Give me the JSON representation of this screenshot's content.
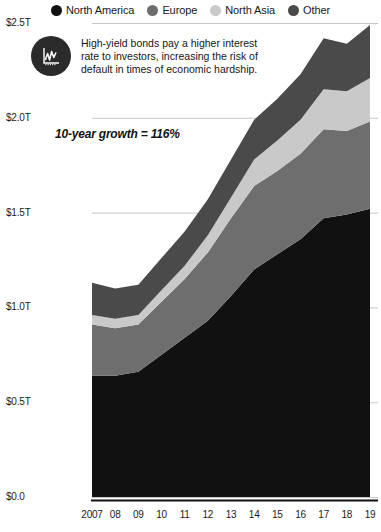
{
  "legend": {
    "position": "top-center",
    "items": [
      {
        "label": "North America",
        "color": "#111111",
        "icon": "legend-dot-icon"
      },
      {
        "label": "Europe",
        "color": "#6e6e6e",
        "icon": "legend-dot-icon"
      },
      {
        "label": "North Asia",
        "color": "#c9c9c9",
        "icon": "legend-dot-icon"
      },
      {
        "label": "Other",
        "color": "#4a4a4a",
        "icon": "legend-dot-icon"
      }
    ]
  },
  "callout": {
    "icon": "line-chart-badge-icon",
    "text": "High-yield bonds pay a higher interest rate to investors, increasing the risk of default in times of economic hardship."
  },
  "growth_note": "10-year growth = 116%",
  "axes": {
    "y_ticks": [
      "$0.0",
      "$0.5T",
      "$1.0T",
      "$1.5T",
      "$2.0T",
      "$2.5T"
    ],
    "x_ticks": [
      "2007",
      "08",
      "09",
      "10",
      "11",
      "12",
      "13",
      "14",
      "15",
      "16",
      "17",
      "18",
      "19"
    ]
  },
  "chart_data": {
    "type": "area",
    "title": "",
    "subtitle": "",
    "xlabel": "",
    "ylabel": "",
    "stacked": true,
    "grid": true,
    "legend_position": "top",
    "ylim": [
      0,
      2.5
    ],
    "ytick_values": [
      0,
      0.5,
      1.0,
      1.5,
      2.0,
      2.5
    ],
    "ytick_labels": [
      "$0.0",
      "$0.5T",
      "$1.0T",
      "$1.5T",
      "$2.0T",
      "$2.5T"
    ],
    "units": "USD trillions",
    "categories": [
      "2007",
      "08",
      "09",
      "10",
      "11",
      "12",
      "13",
      "14",
      "15",
      "16",
      "17",
      "18",
      "19"
    ],
    "x": [
      2007,
      2008,
      2009,
      2010,
      2011,
      2012,
      2013,
      2014,
      2015,
      2016,
      2017,
      2018,
      2019
    ],
    "series": [
      {
        "name": "North America",
        "color": "#111111",
        "values": [
          0.64,
          0.64,
          0.66,
          0.75,
          0.84,
          0.93,
          1.06,
          1.2,
          1.28,
          1.36,
          1.47,
          1.49,
          1.52
        ]
      },
      {
        "name": "Europe",
        "color": "#6e6e6e",
        "values": [
          0.27,
          0.25,
          0.25,
          0.28,
          0.31,
          0.36,
          0.41,
          0.44,
          0.44,
          0.45,
          0.47,
          0.44,
          0.46
        ]
      },
      {
        "name": "North Asia",
        "color": "#c9c9c9",
        "values": [
          0.05,
          0.05,
          0.05,
          0.06,
          0.07,
          0.09,
          0.11,
          0.14,
          0.16,
          0.18,
          0.21,
          0.21,
          0.23
        ]
      },
      {
        "name": "Other",
        "color": "#4a4a4a",
        "values": [
          0.17,
          0.16,
          0.16,
          0.17,
          0.18,
          0.19,
          0.2,
          0.21,
          0.22,
          0.24,
          0.27,
          0.25,
          0.28
        ]
      }
    ],
    "totals": [
      1.13,
      1.1,
      1.12,
      1.26,
      1.4,
      1.57,
      1.78,
      1.99,
      2.1,
      2.23,
      2.42,
      2.39,
      2.49
    ],
    "annotations": [
      {
        "text": "10-year growth = 116%",
        "x": 2010.5,
        "y": 1.85
      },
      {
        "text": "High-yield bonds pay a higher interest rate to investors, increasing the risk of default in times of economic hardship.",
        "x": 2008.2,
        "y": 2.3
      }
    ]
  },
  "style": {
    "background": "#ffffff",
    "grid_color": "#c8c8c8",
    "axis_color": "#111111",
    "text_color": "#1a1a1a"
  }
}
